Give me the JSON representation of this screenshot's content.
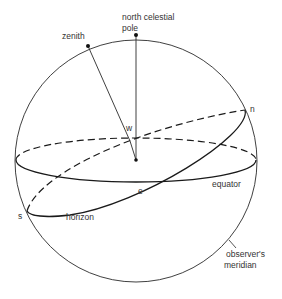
{
  "diagram": {
    "labels": {
      "pole_line1": "north celestial",
      "pole_line2": "pole",
      "zenith": "zenith",
      "west": "w",
      "north": "n",
      "east": "e",
      "south": "s",
      "equator": "equator",
      "horizon": "horizon",
      "meridian_line1": "observer's",
      "meridian_line2": "meridian"
    },
    "colors": {
      "line": "#1a1a1a",
      "text": "#333333",
      "background": "#ffffff"
    }
  }
}
